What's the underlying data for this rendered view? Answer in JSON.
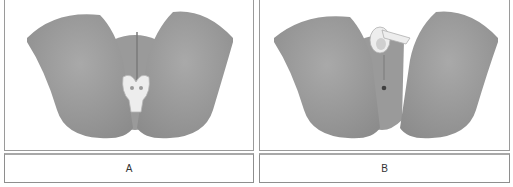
{
  "figure": {
    "panels": [
      {
        "id": "A",
        "label": "A",
        "illustration": "anatomical-model-with-perineal-pad"
      },
      {
        "id": "B",
        "label": "B",
        "illustration": "anatomical-model-with-ring-device"
      }
    ],
    "colors": {
      "model_fill": "#9c9c9c",
      "model_shadow": "#8a8a8a",
      "device_fill": "#ececec",
      "border": "#9a9a9a"
    }
  }
}
